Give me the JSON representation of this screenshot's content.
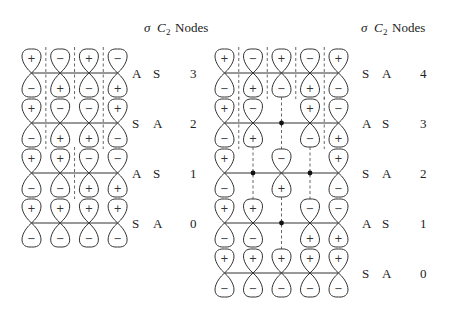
{
  "header": {
    "sigma": "σ",
    "c2": "C",
    "c2_sub": "2",
    "nodes": "Nodes"
  },
  "panels": [
    {
      "name": "four-atom-system",
      "atoms": 4,
      "orbitals": [
        {
          "signs": [
            "+",
            "-",
            "+",
            "-"
          ],
          "nodes_at": [
            0.5,
            1.5,
            2.5
          ],
          "dots_at": [],
          "sigma": "A",
          "c2": "S",
          "nodes": "3"
        },
        {
          "signs": [
            "+",
            "-",
            "-",
            "+"
          ],
          "nodes_at": [
            0.5,
            2.5
          ],
          "dots_at": [],
          "sigma": "S",
          "c2": "A",
          "nodes": "2"
        },
        {
          "signs": [
            "+",
            "+",
            "-",
            "-"
          ],
          "nodes_at": [
            1.5
          ],
          "dots_at": [],
          "sigma": "A",
          "c2": "S",
          "nodes": "1"
        },
        {
          "signs": [
            "+",
            "+",
            "+",
            "+"
          ],
          "nodes_at": [],
          "dots_at": [],
          "sigma": "S",
          "c2": "A",
          "nodes": "0"
        }
      ]
    },
    {
      "name": "five-atom-system",
      "atoms": 5,
      "orbitals": [
        {
          "signs": [
            "+",
            "-",
            "+",
            "-",
            "+"
          ],
          "nodes_at": [
            0.5,
            1.5,
            2.5,
            3.5
          ],
          "dots_at": [],
          "sigma": "S",
          "c2": "A",
          "nodes": "4"
        },
        {
          "signs": [
            "+",
            "-",
            "0",
            "+",
            "-"
          ],
          "nodes_at": [
            0.5,
            2,
            3.5
          ],
          "dots_at": [
            2
          ],
          "sigma": "A",
          "c2": "S",
          "nodes": "3"
        },
        {
          "signs": [
            "+",
            "0",
            "-",
            "0",
            "+"
          ],
          "nodes_at": [
            1,
            3
          ],
          "dots_at": [
            1,
            3
          ],
          "sigma": "S",
          "c2": "A",
          "nodes": "2"
        },
        {
          "signs": [
            "+",
            "+",
            "0",
            "-",
            "-"
          ],
          "nodes_at": [
            2
          ],
          "dots_at": [
            2
          ],
          "sigma": "A",
          "c2": "S",
          "nodes": "1"
        },
        {
          "signs": [
            "+",
            "+",
            "+",
            "+",
            "+"
          ],
          "nodes_at": [],
          "dots_at": [],
          "sigma": "S",
          "c2": "A",
          "nodes": "0"
        }
      ]
    }
  ]
}
